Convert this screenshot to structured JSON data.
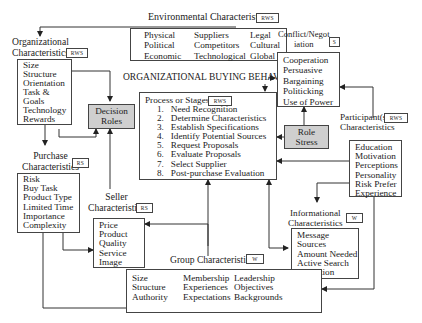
{
  "title": "ORGANIZATIONAL BUYING BEHAVIOR",
  "environmental": {
    "label": "Environmental Characteristics",
    "tag": "RWS",
    "col1": [
      "Physical",
      "Political",
      "Economic"
    ],
    "col2": [
      "Suppliers",
      "Competitors",
      "Technological"
    ],
    "col3": [
      "Legal",
      "Cultural",
      "Global"
    ]
  },
  "organizational": {
    "label_line1": "Organizational",
    "label_line2": "Characteristics",
    "tag": "RWS",
    "items": [
      "Size",
      "Structure",
      "Orientation",
      "Task &",
      "Goals",
      "Technology",
      "Rewards"
    ]
  },
  "decision_roles": {
    "line1": "Decision",
    "line2": "Roles"
  },
  "conflict": {
    "label_line1": "Conflict/Negot",
    "label_line2": "iation",
    "tag": "S",
    "items": [
      "Cooperation",
      "Persuasive",
      "Bargaining",
      "Politicking",
      "Use of Power"
    ]
  },
  "process": {
    "label": "Process or Stages",
    "tag": "RWS",
    "steps": [
      {
        "n": "1.",
        "text": "Need Recognition"
      },
      {
        "n": "2.",
        "text": "Determine Characteristics"
      },
      {
        "n": "3.",
        "text": "Establish Specifications"
      },
      {
        "n": "4.",
        "text": "Identify Potential Sources"
      },
      {
        "n": "5.",
        "text": "Request Proposals"
      },
      {
        "n": "6.",
        "text": "Evaluate Proposals"
      },
      {
        "n": "7.",
        "text": "Select Supplier"
      },
      {
        "n": "8.",
        "text": "Post-purchase Evaluation"
      }
    ]
  },
  "role_stress": {
    "line1": "Role",
    "line2": "Stress"
  },
  "participants": {
    "label_line1": "Participant(s)",
    "label_line2": "Characteristics",
    "tag": "RWS",
    "items": [
      "Education",
      "Motivation",
      "Perceptions",
      "Personality",
      "Risk Prefer",
      "Experience"
    ]
  },
  "purchase": {
    "label_line1": "Purchase",
    "label_line2": "Characteristics",
    "tag": "RS",
    "items": [
      "Risk",
      "Buy Task",
      "Product Type",
      "Limited Time",
      "Importance",
      "Complexity"
    ]
  },
  "seller": {
    "label_line1": "Seller",
    "label_line2": "Characteristics",
    "tag": "RS",
    "items": [
      "Price",
      "Product",
      "Quality",
      "Service",
      "Image"
    ]
  },
  "informational": {
    "label_line1": "Informational",
    "label_line2": "Characteristics",
    "tag": "W",
    "items": [
      "Message",
      "Sources",
      "Amount Needed",
      "Active Search",
      "Distortion"
    ]
  },
  "group": {
    "label": "Group Characteristics",
    "tag": "W",
    "col1": [
      "Size",
      "Structure",
      "Authority"
    ],
    "col2": [
      "Membership",
      "Experiences",
      "Expectations"
    ],
    "col3": [
      "Leadership",
      "Objectives",
      "Backgrounds"
    ]
  }
}
